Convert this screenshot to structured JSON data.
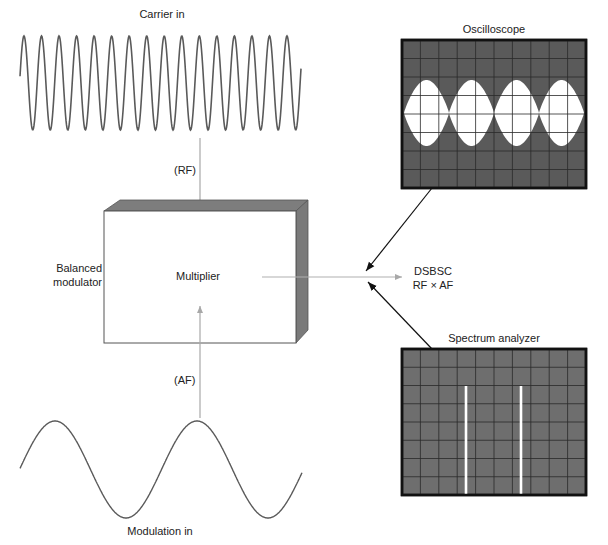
{
  "carrier": {
    "label": "Carrier in",
    "signal_tag": "(RF)",
    "cycles": 16,
    "color": "#555555"
  },
  "modulation": {
    "label": "Modulation in",
    "signal_tag": "(AF)",
    "cycles": 2,
    "color": "#555555"
  },
  "modulator": {
    "side_label_line1": "Balanced",
    "side_label_line2": "modulator",
    "inner_label": "Multiplier",
    "face_color": "#ffffff",
    "shade_color": "#7a7a7a"
  },
  "output": {
    "label_line1": "DSBSC",
    "label_line2": "RF × AF",
    "arrow_color": "#b0b0b0"
  },
  "oscilloscope": {
    "title": "Oscilloscope",
    "screen_color": "#5a5a5a",
    "grid_cols": 10,
    "grid_rows": 8,
    "envelope_lobes": 4,
    "trace_color": "#ffffff"
  },
  "spectrum_analyzer": {
    "title": "Spectrum analyzer",
    "screen_color": "#6e6e6e",
    "grid_cols": 10,
    "grid_rows": 8,
    "spectral_lines": 2,
    "trace_color": "#ffffff"
  }
}
